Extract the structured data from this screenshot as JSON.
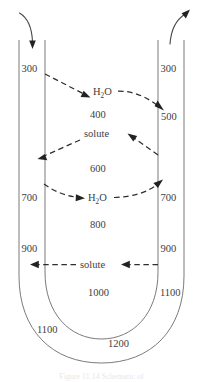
{
  "figure": {
    "caption_partial": "Figure 11.14  Schematic of",
    "colors": {
      "wall": "#6b6b6b",
      "dash": "#2e2e2e",
      "text": "#3d3d3d",
      "arrow": "#4a4a4a",
      "background": "#ffffff"
    },
    "osmolality_labels": {
      "descending_top": "300",
      "ascending_top": "300",
      "interstitium_400": "400",
      "ascending_500": "500",
      "interstitium_600": "600",
      "descending_700": "700",
      "ascending_700": "700",
      "interstitium_800": "800",
      "descending_900": "900",
      "ascending_900": "900",
      "interstitium_1000": "1000",
      "ascending_1100": "1100",
      "outer_1100": "1100",
      "bottom_1200": "1200"
    },
    "transport_labels": {
      "water_upper": "H",
      "water_upper_sub": "2",
      "water_upper_rest": "O",
      "solute_upper": "solute",
      "water_lower": "H",
      "water_lower_sub": "2",
      "water_lower_rest": "O",
      "solute_lower": "solute"
    },
    "flow_arrows": {
      "inflow": "descending-limb-inflow-arrow",
      "outflow": "ascending-limb-outflow-arrow"
    }
  }
}
